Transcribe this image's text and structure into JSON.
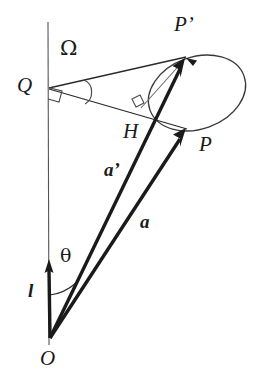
{
  "figure": {
    "type": "geometric-vector-diagram",
    "width": 258,
    "height": 379,
    "background_color": "#ffffff",
    "stroke_color": "#1a1a1a",
    "thin_stroke_color": "#4a4a4a"
  },
  "labels": {
    "origin": "O",
    "vertex_q": "Q",
    "point_p": "P",
    "point_p_prime": "P’",
    "foot_h": "H",
    "vector_a": "a",
    "vector_a_prime": "a’",
    "axis_l": "l",
    "angle_theta": "θ",
    "solid_angle_omega": "Ω"
  },
  "geometry": {
    "origin_point": {
      "x": 50,
      "y": 338
    },
    "q_point": {
      "x": 49,
      "y": 88
    },
    "p_point": {
      "x": 185,
      "y": 128
    },
    "p_prime_point": {
      "x": 185,
      "y": 58
    },
    "h_point": {
      "x": 144,
      "y": 109
    },
    "axis_top": {
      "x": 48,
      "y": 22
    },
    "l_arrow_tip": {
      "x": 49,
      "y": 261
    },
    "ellipse_center": {
      "x": 197,
      "y": 93
    },
    "ellipse_rx": 50,
    "ellipse_ry": 36,
    "ellipse_rotation_deg": -20
  },
  "markers": {
    "right_angle_at_q": true,
    "right_angle_at_h": true,
    "angle_arc_omega": true,
    "angle_arc_theta": true
  }
}
